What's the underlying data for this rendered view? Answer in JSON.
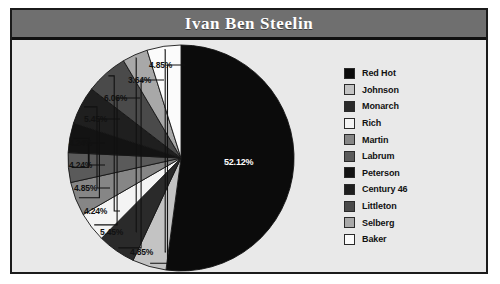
{
  "title": "Ivan Ben Steelin",
  "colors": {
    "frame_border": "#1b1b1b",
    "title_bar": "#6f6f6f",
    "title_text": "#ffffff",
    "plot_background": "#e9e9e9",
    "label_text": "#111111"
  },
  "chart_data": {
    "type": "pie",
    "title": "Ivan Ben Steelin",
    "xlabel": "",
    "ylabel": "",
    "legend_position": "right",
    "grid": false,
    "categories": [
      "Red Hot",
      "Johnson",
      "Monarch",
      "Rich",
      "Martin",
      "Labrum",
      "Peterson",
      "Century 46",
      "Littleton",
      "Selberg",
      "Baker"
    ],
    "values": [
      52.12,
      4.85,
      5.45,
      4.24,
      4.85,
      4.24,
      4.24,
      5.45,
      6.06,
      3.64,
      4.85
    ],
    "value_labels": [
      "52.12%",
      "4.85%",
      "5.45%",
      "4.24%",
      "4.85%",
      "4.24%",
      "4.24%",
      "5.45%",
      "6.06%",
      "3.64%",
      "4.85%"
    ],
    "slice_colors": [
      "#0b0b0b",
      "#c3c3c3",
      "#2a2a2a",
      "#f4f4f4",
      "#868686",
      "#5a5a5a",
      "#131313",
      "#1f1f1f",
      "#4a4a4a",
      "#a8a8a8",
      "#fbfbfb"
    ],
    "start_angle_deg": 0,
    "direction": "clockwise",
    "units": "percent"
  },
  "legend": {
    "items": [
      {
        "label": "Red Hot",
        "color": "#0b0b0b"
      },
      {
        "label": "Johnson",
        "color": "#c3c3c3"
      },
      {
        "label": "Monarch",
        "color": "#2a2a2a"
      },
      {
        "label": "Rich",
        "color": "#f4f4f4"
      },
      {
        "label": "Martin",
        "color": "#868686"
      },
      {
        "label": "Labrum",
        "color": "#5a5a5a"
      },
      {
        "label": "Peterson",
        "color": "#131313"
      },
      {
        "label": "Century 46",
        "color": "#1f1f1f"
      },
      {
        "label": "Littleton",
        "color": "#4a4a4a"
      },
      {
        "label": "Selberg",
        "color": "#a8a8a8"
      },
      {
        "label": "Baker",
        "color": "#fbfbfb"
      }
    ]
  },
  "labels": {
    "center": "52.12%",
    "callouts": [
      {
        "text": "4.85%",
        "left": 133,
        "top": 17
      },
      {
        "text": "3.64%",
        "left": 112,
        "top": 32
      },
      {
        "text": "6.06%",
        "left": 88,
        "top": 50
      },
      {
        "text": "5.45%",
        "left": 68,
        "top": 71
      },
      {
        "text": "4.24%",
        "left": 53,
        "top": 95
      },
      {
        "text": "4.24%",
        "left": 53,
        "top": 117
      },
      {
        "text": "4.85%",
        "left": 58,
        "top": 140
      },
      {
        "text": "4.24%",
        "left": 68,
        "top": 163
      },
      {
        "text": "5.45%",
        "left": 84,
        "top": 184
      },
      {
        "text": "4.85%",
        "left": 114,
        "top": 204
      }
    ]
  }
}
